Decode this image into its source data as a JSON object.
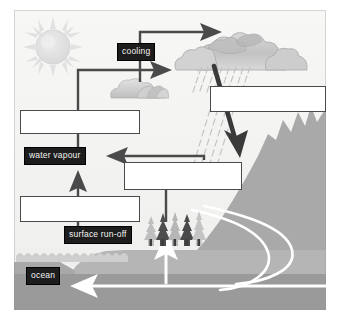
{
  "diagram": {
    "type": "labelled-diagram",
    "colors": {
      "background": "#f4f4f2",
      "label_fill": "#1d1d1d",
      "label_text": "#f2f2f2",
      "answer_box_fill": "#ffffff",
      "answer_box_border": "#4a4a4a",
      "arrow_dark": "#474747",
      "arrow_white": "#ffffff",
      "mountain": "#a9a9a9",
      "land": "#b5b5b5",
      "ocean": "#9a9a9a",
      "cloud": "#c9c9c9",
      "sun": "#e0e0e0",
      "tree_light": "#bdbdbd",
      "tree_dark": "#555555",
      "rain": "#c4c4c4"
    },
    "labels": [
      {
        "id": "cooling",
        "text": "cooling",
        "kind": "filled"
      },
      {
        "id": "water-vapour",
        "text": "water vapour",
        "kind": "filled"
      },
      {
        "id": "surface-run-off",
        "text": "surface run-off",
        "kind": "filled"
      },
      {
        "id": "ocean",
        "text": "ocean",
        "kind": "filled"
      }
    ],
    "answer_boxes": [
      {
        "id": "answer-box-1",
        "text": "",
        "position": "upper-left"
      },
      {
        "id": "answer-box-2",
        "text": "",
        "position": "right-precipitation"
      },
      {
        "id": "answer-box-3",
        "text": "",
        "position": "middle-right"
      },
      {
        "id": "answer-box-4",
        "text": "",
        "position": "lower-left"
      }
    ],
    "scenery": [
      {
        "id": "sun",
        "text": "sun"
      },
      {
        "id": "small-cloud",
        "text": "small cloud"
      },
      {
        "id": "storm-clouds",
        "text": "rain clouds"
      },
      {
        "id": "rainfall",
        "text": "falling rain"
      },
      {
        "id": "mountain",
        "text": "mountain"
      },
      {
        "id": "trees",
        "text": "coniferous trees"
      },
      {
        "id": "ocean-body",
        "text": "ocean"
      },
      {
        "id": "groundwater",
        "text": "groundwater flow"
      }
    ]
  }
}
